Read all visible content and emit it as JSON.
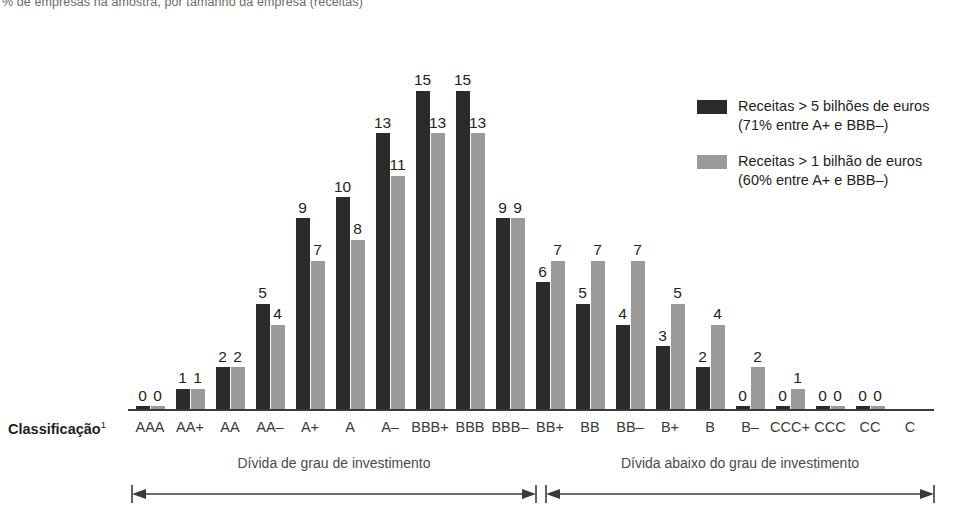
{
  "subtitle": "% de empresas na amostra, por tamanho da empresa (receitas)",
  "axis": {
    "title": "Classificação",
    "title_superscript": "1"
  },
  "legend": {
    "items": [
      {
        "color": "#2c2a2b",
        "line1": "Receitas > 5 bilhões de euros",
        "line2": "(71% entre A+ e BBB–)"
      },
      {
        "color": "#9a9a99",
        "line1": "Receitas > 1 bilhão de euros",
        "line2": "(60% entre A+ e BBB–)"
      }
    ]
  },
  "brackets": [
    {
      "label": "Dívida de grau de investimento",
      "from": "AAA",
      "to": "BBB–"
    },
    {
      "label": "Dívida abaixo do grau de investimento",
      "from": "BB+",
      "to": "C"
    }
  ],
  "chart_data": {
    "type": "bar",
    "title": "",
    "subtitle": "% de empresas na amostra, por tamanho da empresa (receitas)",
    "xlabel": "Classificação",
    "ylabel": "",
    "ylim": [
      0,
      16
    ],
    "grid": false,
    "legend_position": "right",
    "categories": [
      "AAA",
      "AA+",
      "AA",
      "AA–",
      "A+",
      "A",
      "A–",
      "BBB+",
      "BBB",
      "BBB–",
      "BB+",
      "BB",
      "BB–",
      "B+",
      "B",
      "B–",
      "CCC+",
      "CCC",
      "CC",
      "C"
    ],
    "series": [
      {
        "name": "Receitas > 5 bilhões de euros",
        "color": "#2c2a2b",
        "values": [
          0,
          1,
          2,
          5,
          9,
          10,
          13,
          15,
          15,
          9,
          6,
          5,
          4,
          3,
          2,
          0,
          0,
          0,
          0,
          null
        ],
        "labels": [
          "0",
          "1",
          "2",
          "5",
          "9",
          "10",
          "13",
          "15",
          "15",
          "9",
          "6",
          "5",
          "4",
          "3",
          "2",
          "0",
          "0",
          "0",
          "0",
          ""
        ]
      },
      {
        "name": "Receitas > 1 bilhão de euros",
        "color": "#9a9a99",
        "values": [
          0,
          1,
          2,
          4,
          7,
          8,
          11,
          13,
          13,
          9,
          7,
          7,
          7,
          5,
          4,
          2,
          1,
          0,
          0,
          null
        ],
        "labels": [
          "0",
          "1",
          "2",
          "4",
          "7",
          "8",
          "11",
          "13",
          "13",
          "9",
          "7",
          "7",
          "7",
          "5",
          "4",
          "2",
          "1",
          "0",
          "0",
          ""
        ]
      }
    ]
  }
}
